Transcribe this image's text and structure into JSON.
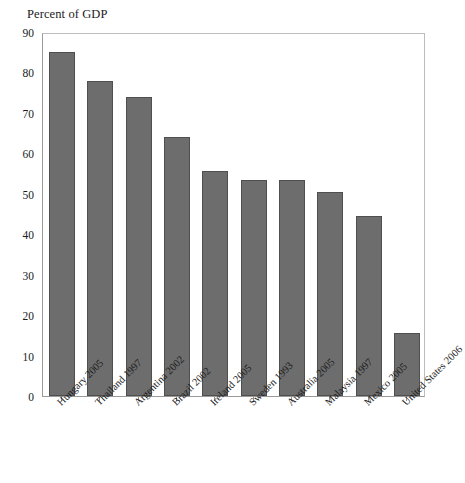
{
  "chart_data": {
    "type": "bar",
    "title": "Percent of GDP",
    "xlabel": "",
    "ylabel": "",
    "ylim": [
      0,
      90
    ],
    "ytick_step": 10,
    "yticks": [
      0,
      10,
      20,
      30,
      40,
      50,
      60,
      70,
      80,
      90
    ],
    "grid": false,
    "legend": "none",
    "orientation": "vertical",
    "bar_color": "#6d6d6d",
    "bar_edge_color": "#4f4f4f",
    "categories": [
      "Hungary 2005",
      "Thailand 1997",
      "Argentina 2002",
      "Brazil 2002",
      "Ireland 2005",
      "Sweden 1993",
      "Australia 2005",
      "Malaysia 1997",
      "Mexico 2005",
      "United States 2006"
    ],
    "values": [
      85.0,
      78.0,
      74.0,
      64.0,
      55.6,
      53.5,
      53.5,
      50.5,
      44.4,
      15.5
    ]
  },
  "figure": {
    "background_color": "#ffffff",
    "frame_color": "#9a9a9a"
  }
}
